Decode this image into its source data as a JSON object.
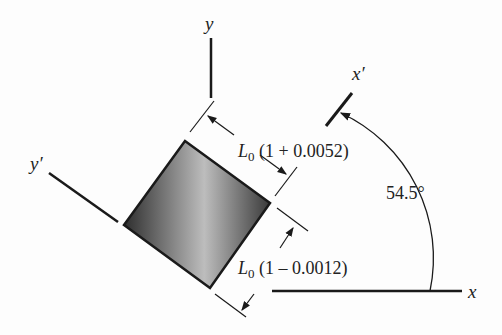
{
  "diagram": {
    "axes": {
      "x": "x",
      "y": "y",
      "x_prime": "x′",
      "y_prime": "y′"
    },
    "angle_label": "54.5°",
    "dim_top": {
      "symbol": "L",
      "subscript": "0",
      "expr": " (1 + 0.0052)"
    },
    "dim_bottom": {
      "symbol": "L",
      "subscript": "0",
      "expr": " (1 – 0.0012)"
    },
    "colors": {
      "line": "#1a1a1a",
      "fill_dark": "#3a3a3a",
      "fill_light": "#d8d8d8"
    }
  }
}
